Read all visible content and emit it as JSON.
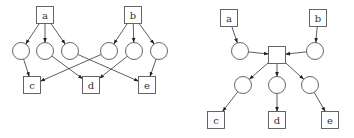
{
  "diagrams": [
    {
      "name": "left-graph",
      "boxes": [
        {
          "id": "a",
          "label": "a",
          "x": 45,
          "y": 15
        },
        {
          "id": "b",
          "label": "b",
          "x": 133,
          "y": 15
        },
        {
          "id": "c",
          "label": "c",
          "x": 32,
          "y": 85
        },
        {
          "id": "d",
          "label": "d",
          "x": 91,
          "y": 85
        },
        {
          "id": "e",
          "label": "e",
          "x": 147,
          "y": 85
        }
      ],
      "circles": [
        {
          "id": "n1",
          "x": 21,
          "y": 51
        },
        {
          "id": "n2",
          "x": 45,
          "y": 51
        },
        {
          "id": "n3",
          "x": 70,
          "y": 51
        },
        {
          "id": "n4",
          "x": 109,
          "y": 51
        },
        {
          "id": "n5",
          "x": 134,
          "y": 51
        },
        {
          "id": "n6",
          "x": 159,
          "y": 51
        }
      ],
      "edges": [
        [
          "a",
          "n1"
        ],
        [
          "a",
          "n2"
        ],
        [
          "a",
          "n3"
        ],
        [
          "b",
          "n4"
        ],
        [
          "b",
          "n5"
        ],
        [
          "b",
          "n6"
        ],
        [
          "n1",
          "c"
        ],
        [
          "n2",
          "d"
        ],
        [
          "n3",
          "e"
        ],
        [
          "n4",
          "c"
        ],
        [
          "n5",
          "d"
        ],
        [
          "n6",
          "e"
        ]
      ]
    },
    {
      "name": "right-graph",
      "boxes": [
        {
          "id": "a",
          "label": "a",
          "x": 229,
          "y": 18
        },
        {
          "id": "b",
          "label": "b",
          "x": 318,
          "y": 18
        },
        {
          "id": "hub",
          "label": "",
          "x": 277,
          "y": 55
        },
        {
          "id": "c",
          "label": "c",
          "x": 216,
          "y": 120
        },
        {
          "id": "d",
          "label": "d",
          "x": 277,
          "y": 120
        },
        {
          "id": "e",
          "label": "e",
          "x": 330,
          "y": 120
        }
      ],
      "circles": [
        {
          "id": "m1",
          "x": 240,
          "y": 51
        },
        {
          "id": "m2",
          "x": 315,
          "y": 51
        },
        {
          "id": "m3",
          "x": 243,
          "y": 85
        },
        {
          "id": "m4",
          "x": 277,
          "y": 85
        },
        {
          "id": "m5",
          "x": 310,
          "y": 85
        }
      ],
      "edges": [
        [
          "a",
          "m1"
        ],
        [
          "b",
          "m2"
        ],
        [
          "m1",
          "hub"
        ],
        [
          "m2",
          "hub"
        ],
        [
          "hub",
          "m3"
        ],
        [
          "hub",
          "m4"
        ],
        [
          "hub",
          "m5"
        ],
        [
          "m3",
          "c"
        ],
        [
          "m4",
          "d"
        ],
        [
          "m5",
          "e"
        ]
      ]
    }
  ],
  "style": {
    "box_half": 8.5,
    "circle_r": 8.5,
    "stroke": "#555555"
  }
}
